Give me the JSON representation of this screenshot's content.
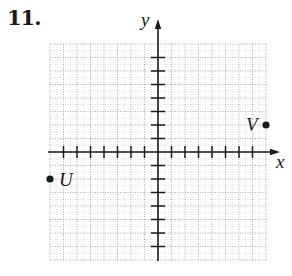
{
  "problem": {
    "number": "11."
  },
  "chart_data": {
    "type": "scatter",
    "title": "",
    "xlabel": "x",
    "ylabel": "y",
    "xlim": [
      -8,
      8
    ],
    "ylim": [
      -8,
      8
    ],
    "grid": true,
    "grid_style": "dotted",
    "tick_spacing": 1,
    "x_ticks": [
      -7,
      -6,
      -5,
      -4,
      -3,
      -2,
      -1,
      1,
      2,
      3,
      4,
      5,
      6,
      7
    ],
    "y_ticks": [
      -7,
      -6,
      -5,
      -4,
      -3,
      -2,
      -1,
      1,
      2,
      3,
      4,
      5,
      6,
      7
    ],
    "tick_labels_shown": false,
    "points": [
      {
        "label": "V",
        "x": 8,
        "y": 2
      },
      {
        "label": "U",
        "x": -8,
        "y": -2
      }
    ]
  },
  "colors": {
    "ink": "#1a1a1a",
    "grid": "#9a9a9a"
  }
}
